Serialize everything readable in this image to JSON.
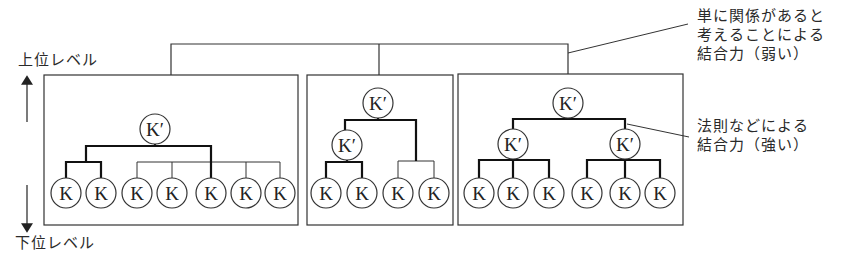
{
  "labels": {
    "upper_level": "上位レベル",
    "lower_level": "下位レベル",
    "weak_binding": "単に関係があると\n考えることによる\n結合力（弱い）",
    "strong_binding": "法則などによる\n結合力（強い）"
  },
  "node_labels": {
    "leaf": "K",
    "parent": "K′"
  },
  "colors": {
    "line": "#333333",
    "strong_line": "#111111",
    "background": "#ffffff"
  },
  "groups": [
    {
      "id": "group-1",
      "box": [
        44,
        75,
        298,
        225
      ],
      "parents": [
        {
          "x": 155,
          "y": 129,
          "label": "K′"
        }
      ],
      "leaves": [
        {
          "x": 66
        },
        {
          "x": 101
        },
        {
          "x": 137
        },
        {
          "x": 172
        },
        {
          "x": 211
        },
        {
          "x": 246
        },
        {
          "x": 280
        }
      ],
      "strong_edges": [
        [
          [
            155,
            144
          ],
          [
            155,
            146
          ],
          [
            86,
            146
          ],
          [
            86,
            162
          ]
        ],
        [
          [
            86,
            162
          ],
          [
            66,
            162
          ],
          [
            66,
            178
          ]
        ],
        [
          [
            86,
            162
          ],
          [
            101,
            162
          ],
          [
            101,
            178
          ]
        ],
        [
          [
            155,
            146
          ],
          [
            211,
            146
          ],
          [
            211,
            178
          ]
        ]
      ],
      "weak_edges": [
        [
          [
            137,
            162
          ],
          [
            280,
            162
          ]
        ],
        [
          [
            137,
            162
          ],
          [
            137,
            178
          ]
        ],
        [
          [
            172,
            162
          ],
          [
            172,
            178
          ]
        ],
        [
          [
            246,
            162
          ],
          [
            246,
            178
          ]
        ],
        [
          [
            280,
            162
          ],
          [
            280,
            178
          ]
        ]
      ]
    },
    {
      "id": "group-2",
      "box": [
        307,
        75,
        453,
        225
      ],
      "parents": [
        {
          "x": 378,
          "y": 103,
          "label": "K′"
        },
        {
          "x": 347,
          "y": 145,
          "label": "K′"
        }
      ],
      "leaves": [
        {
          "x": 326
        },
        {
          "x": 362
        },
        {
          "x": 398
        },
        {
          "x": 434
        }
      ],
      "strong_edges": [
        [
          [
            378,
            118
          ],
          [
            378,
            120
          ],
          [
            345,
            120
          ],
          [
            345,
            130
          ]
        ],
        [
          [
            378,
            120
          ],
          [
            416,
            120
          ],
          [
            416,
            161
          ]
        ],
        [
          [
            347,
            160
          ],
          [
            347,
            162
          ],
          [
            326,
            162
          ],
          [
            326,
            178
          ]
        ],
        [
          [
            347,
            162
          ],
          [
            362,
            162
          ],
          [
            362,
            178
          ]
        ]
      ],
      "weak_edges": [
        [
          [
            398,
            161
          ],
          [
            434,
            161
          ]
        ],
        [
          [
            398,
            161
          ],
          [
            398,
            178
          ]
        ],
        [
          [
            434,
            161
          ],
          [
            434,
            178
          ]
        ]
      ]
    },
    {
      "id": "group-3",
      "box": [
        458,
        74,
        683,
        225
      ],
      "parents": [
        {
          "x": 568,
          "y": 103,
          "label": "K′"
        },
        {
          "x": 513,
          "y": 144,
          "label": "K′"
        },
        {
          "x": 625,
          "y": 144,
          "label": "K′"
        }
      ],
      "leaves": [
        {
          "x": 479
        },
        {
          "x": 513
        },
        {
          "x": 549
        },
        {
          "x": 587
        },
        {
          "x": 625
        },
        {
          "x": 660
        }
      ],
      "strong_edges": [
        [
          [
            568,
            118
          ],
          [
            568,
            119
          ],
          [
            513,
            119
          ],
          [
            513,
            129
          ]
        ],
        [
          [
            568,
            119
          ],
          [
            625,
            119
          ],
          [
            625,
            129
          ]
        ],
        [
          [
            513,
            159
          ],
          [
            513,
            160
          ],
          [
            479,
            160
          ],
          [
            479,
            178
          ]
        ],
        [
          [
            513,
            160
          ],
          [
            513,
            178
          ]
        ],
        [
          [
            513,
            160
          ],
          [
            549,
            160
          ],
          [
            549,
            178
          ]
        ],
        [
          [
            625,
            159
          ],
          [
            625,
            160
          ],
          [
            587,
            160
          ],
          [
            587,
            178
          ]
        ],
        [
          [
            625,
            160
          ],
          [
            625,
            178
          ]
        ],
        [
          [
            625,
            160
          ],
          [
            660,
            160
          ],
          [
            660,
            178
          ]
        ]
      ],
      "weak_edges": []
    }
  ],
  "top_bracket": {
    "y": 44,
    "x_left": 171,
    "x_mid": 379,
    "x_right": 568,
    "y_left_end": 75,
    "y_mid_end": 75,
    "y_right_end": 74
  },
  "leaders": {
    "weak": [
      [
        568,
        53
      ],
      [
        688,
        24
      ]
    ],
    "strong": [
      [
        627,
        124
      ],
      [
        689,
        137
      ]
    ]
  },
  "level_arrow": {
    "x": 27,
    "up": [
      122,
      80
    ],
    "down": [
      185,
      228
    ]
  },
  "leaf_y": 193,
  "node_radius": 15
}
